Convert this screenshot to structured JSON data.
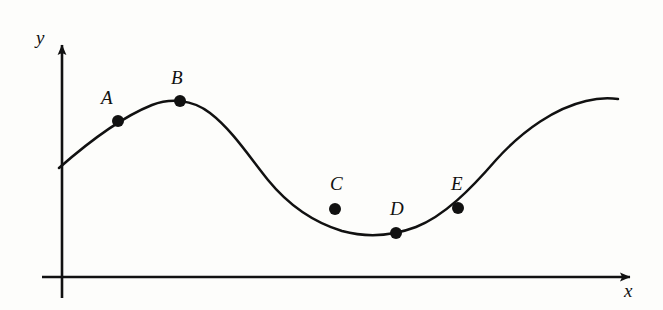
{
  "figure": {
    "background_color": "#fdfdfb",
    "ink_color": "#111111",
    "width": 663,
    "height": 310
  },
  "axes": {
    "origin": {
      "x": 62,
      "y": 277
    },
    "x_axis": {
      "label": "x",
      "label_pos": {
        "x": 624,
        "y": 281
      },
      "start_x": 42,
      "end_x": 634,
      "y": 277,
      "arrow": "right-arrow"
    },
    "y_axis": {
      "label": "y",
      "label_pos": {
        "x": 36,
        "y": 28
      },
      "top_y": 40,
      "bottom_y": 298,
      "x": 62,
      "arrow": "up-arrow"
    }
  },
  "chart_data": {
    "type": "line",
    "title": "",
    "xlabel": "x",
    "ylabel": "y",
    "grid": false,
    "legend": false,
    "curve": {
      "name": "f(x)",
      "start": {
        "x": 59,
        "y": 168
      },
      "end": {
        "x": 618,
        "y": 99
      },
      "path": "M 59,168 C 92,139 122,117 152,105 C 170,98 192,99 210,113 C 232,130 248,155 268,180 C 290,207 316,223 342,231 C 368,238 392,236 416,227 C 444,216 470,190 496,160 C 524,129 556,108 586,101 C 598,98 610,98 618,99"
    },
    "points": [
      {
        "label": "A",
        "x": 118,
        "y": 121,
        "label_x": 101,
        "label_y": 88
      },
      {
        "label": "B",
        "x": 180,
        "y": 101,
        "label_x": 171,
        "label_y": 68
      },
      {
        "label": "C",
        "x": 335,
        "y": 209,
        "label_x": 330,
        "label_y": 174
      },
      {
        "label": "D",
        "x": 396,
        "y": 233,
        "label_x": 390,
        "label_y": 199
      },
      {
        "label": "E",
        "x": 458,
        "y": 208,
        "label_x": 451,
        "label_y": 174
      }
    ]
  }
}
